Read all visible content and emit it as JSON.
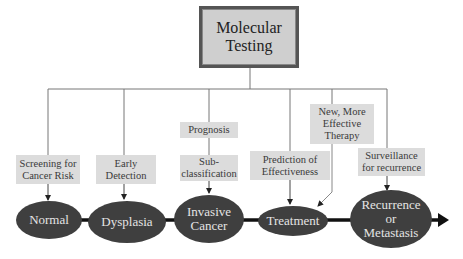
{
  "diagram": {
    "root": {
      "line1": "Molecular",
      "line2": "Testing"
    },
    "applications": [
      {
        "id": "screening",
        "line1": "Screening for",
        "line2": "Cancer Risk"
      },
      {
        "id": "early-detection",
        "line1": "Early",
        "line2": "Detection"
      },
      {
        "id": "prognosis",
        "line1": "Prognosis"
      },
      {
        "id": "subclassification",
        "line1": "Sub-",
        "line2": "classification"
      },
      {
        "id": "prediction",
        "line1": "Prediction of",
        "line2": "Effectiveness"
      },
      {
        "id": "new-therapy",
        "line1": "New, More",
        "line2": "Effective",
        "line3": "Therapy"
      },
      {
        "id": "surveillance",
        "line1": "Surveillance",
        "line2": "for recurrence"
      }
    ],
    "stages": [
      {
        "id": "normal",
        "line1": "Normal"
      },
      {
        "id": "dysplasia",
        "line1": "Dysplasia"
      },
      {
        "id": "invasive-cancer",
        "line1": "Invasive",
        "line2": "Cancer"
      },
      {
        "id": "treatment",
        "line1": "Treatment"
      },
      {
        "id": "recurrence",
        "line1": "Recurrence",
        "line2": "or",
        "line3": "Metastasis"
      }
    ],
    "colors": {
      "stage_fill": "#3f3f3f",
      "stage_text": "#e4e4e4",
      "label_fill": "#dcdcdc",
      "root_fill": "#cfcfcf",
      "connector": "#777777",
      "timeline": "#111111"
    }
  }
}
